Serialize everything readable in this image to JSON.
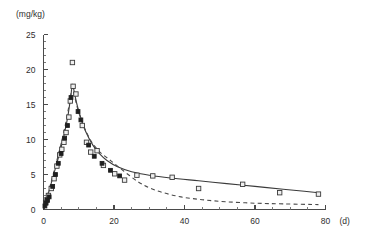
{
  "chart_data": {
    "type": "scatter",
    "title": "",
    "subtitle": "",
    "xlabel": "(d)",
    "ylabel": "(mg/kg)",
    "xlim": [
      0,
      80
    ],
    "ylim": [
      0,
      25
    ],
    "x_ticks": [
      0,
      20,
      40,
      60,
      80
    ],
    "x_tick_labels": [
      "0",
      "20",
      "40",
      "60",
      "80"
    ],
    "x_minor_step": 5,
    "y_ticks": [
      0,
      5,
      10,
      15,
      20,
      25
    ],
    "y_tick_labels": [
      "0",
      "5",
      "10",
      "15",
      "20",
      "25"
    ],
    "y_minor_step": 1,
    "grid": false,
    "legend": "none",
    "series": [
      {
        "name": "observed-open",
        "marker": "open-square",
        "points": [
          [
            0.6,
            1.0
          ],
          [
            1.0,
            1.4
          ],
          [
            1.4,
            2.0
          ],
          [
            2.2,
            3.0
          ],
          [
            3.0,
            4.4
          ],
          [
            3.8,
            6.2
          ],
          [
            4.6,
            7.8
          ],
          [
            5.2,
            8.6
          ],
          [
            5.8,
            9.6
          ],
          [
            6.4,
            11.0
          ],
          [
            7.2,
            13.2
          ],
          [
            7.6,
            15.5
          ],
          [
            8.2,
            21.0
          ],
          [
            8.4,
            17.6
          ],
          [
            9.2,
            16.5
          ],
          [
            11.0,
            12.0
          ],
          [
            12.2,
            9.6
          ],
          [
            13.4,
            8.2
          ],
          [
            15.2,
            8.4
          ],
          [
            17.0,
            6.3
          ],
          [
            20.2,
            5.1
          ],
          [
            23.0,
            4.2
          ],
          [
            26.5,
            4.9
          ],
          [
            31.0,
            4.8
          ],
          [
            36.5,
            4.6
          ],
          [
            44.0,
            3.0
          ],
          [
            56.5,
            3.6
          ],
          [
            67.0,
            2.4
          ],
          [
            78.0,
            2.2
          ]
        ]
      },
      {
        "name": "observed-filled",
        "marker": "filled-square",
        "points": [
          [
            0.4,
            0.5
          ],
          [
            0.7,
            0.9
          ],
          [
            1.1,
            1.3
          ],
          [
            1.6,
            1.8
          ],
          [
            2.6,
            3.3
          ],
          [
            3.4,
            5.0
          ],
          [
            4.2,
            6.6
          ],
          [
            5.0,
            8.0
          ],
          [
            6.0,
            10.2
          ],
          [
            6.8,
            12.0
          ],
          [
            7.8,
            16.0
          ],
          [
            9.8,
            14.0
          ],
          [
            10.6,
            12.8
          ],
          [
            12.8,
            9.2
          ],
          [
            14.4,
            7.6
          ],
          [
            16.6,
            6.6
          ],
          [
            19.0,
            5.6
          ],
          [
            21.6,
            4.8
          ]
        ]
      }
    ],
    "curves": [
      {
        "name": "fitted-solid",
        "style": "solid",
        "points": [
          [
            0.0,
            0.0
          ],
          [
            1.0,
            1.6
          ],
          [
            2.0,
            3.4
          ],
          [
            3.0,
            5.2
          ],
          [
            4.0,
            7.0
          ],
          [
            5.0,
            8.9
          ],
          [
            6.0,
            11.0
          ],
          [
            7.0,
            13.6
          ],
          [
            7.8,
            16.4
          ],
          [
            8.2,
            17.9
          ],
          [
            8.8,
            16.6
          ],
          [
            9.6,
            14.8
          ],
          [
            10.6,
            13.1
          ],
          [
            12.0,
            11.1
          ],
          [
            14.0,
            9.2
          ],
          [
            16.0,
            7.9
          ],
          [
            18.0,
            7.0
          ],
          [
            21.0,
            6.1
          ],
          [
            25.0,
            5.4
          ],
          [
            30.0,
            4.9
          ],
          [
            36.0,
            4.5
          ],
          [
            44.0,
            4.1
          ],
          [
            52.0,
            3.7
          ],
          [
            60.0,
            3.3
          ],
          [
            68.0,
            2.9
          ],
          [
            74.0,
            2.6
          ],
          [
            78.0,
            2.4
          ]
        ]
      },
      {
        "name": "fitted-dashed",
        "style": "dashed",
        "points": [
          [
            0.2,
            0.0
          ],
          [
            1.0,
            1.7
          ],
          [
            2.0,
            3.6
          ],
          [
            3.0,
            5.5
          ],
          [
            4.0,
            7.4
          ],
          [
            5.0,
            9.4
          ],
          [
            6.0,
            11.6
          ],
          [
            7.0,
            14.2
          ],
          [
            7.7,
            16.2
          ],
          [
            8.1,
            17.4
          ],
          [
            8.8,
            16.2
          ],
          [
            9.8,
            14.2
          ],
          [
            11.0,
            12.4
          ],
          [
            12.5,
            10.7
          ],
          [
            14.0,
            9.4
          ],
          [
            16.0,
            8.2
          ],
          [
            18.5,
            7.2
          ],
          [
            21.0,
            6.2
          ],
          [
            24.0,
            5.0
          ],
          [
            27.0,
            3.9
          ],
          [
            30.0,
            3.1
          ],
          [
            34.0,
            2.4
          ],
          [
            39.0,
            1.8
          ],
          [
            45.0,
            1.4
          ],
          [
            52.0,
            1.1
          ],
          [
            60.0,
            0.9
          ],
          [
            68.0,
            0.8
          ],
          [
            78.0,
            0.7
          ]
        ]
      }
    ]
  },
  "axes": {
    "y_unit_label": "(mg/kg)",
    "x_unit_label": "(d)"
  }
}
